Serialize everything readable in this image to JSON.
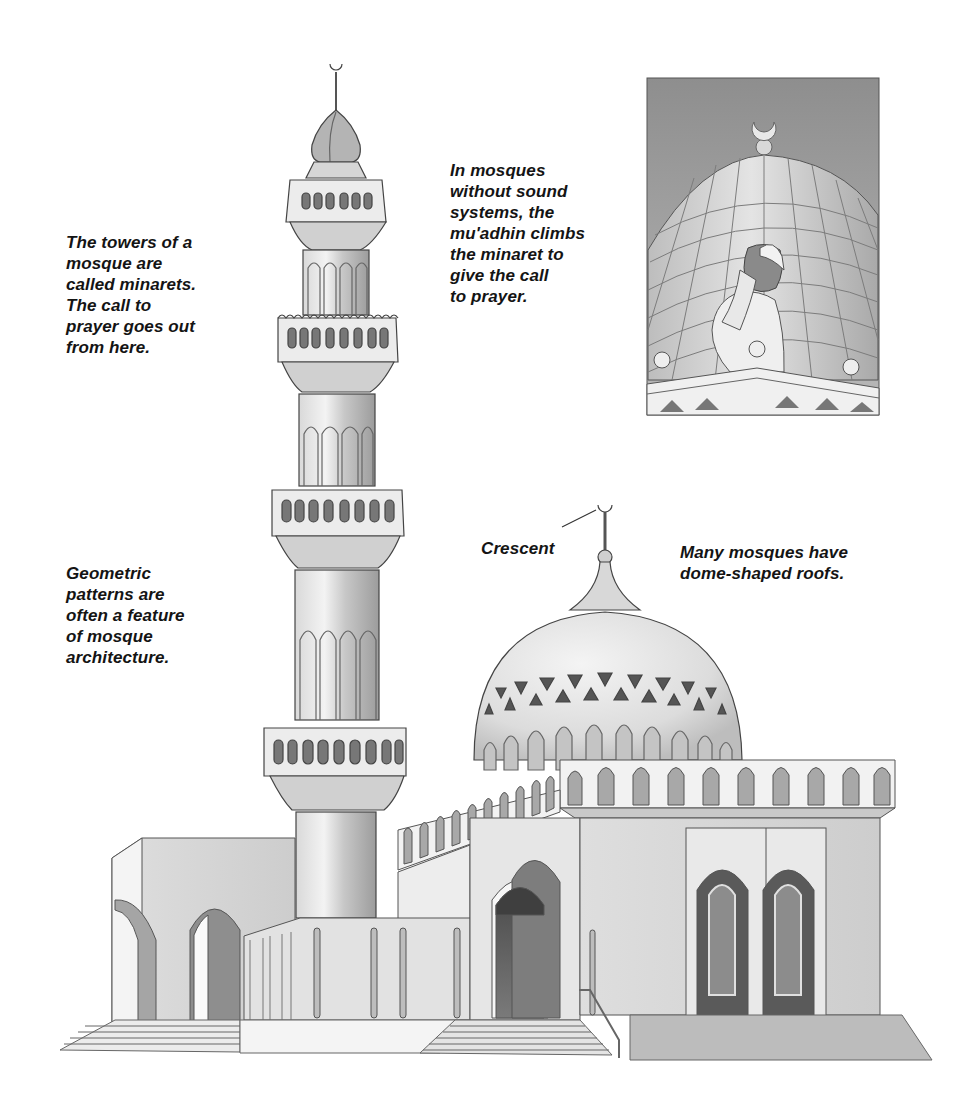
{
  "illustration": {
    "subject": "mosque with minaret and dome",
    "colors": {
      "background": "#ffffff",
      "ink": "#3a3a3a",
      "light_wall": "#e6e6e6",
      "mid_wall": "#cfcfcf",
      "shadow": "#9a9a9a",
      "dark": "#5e5e5e",
      "sky_inset": "#a8a8a8"
    }
  },
  "captions": {
    "minarets": "The towers of a\nmosque are\ncalled minarets.\nThe call to\nprayer goes out\nfrom here.",
    "muadhin": "In mosques\nwithout sound\nsystems, the\nmu'adhin climbs\nthe minaret to\ngive the call\nto prayer.",
    "geometric": "Geometric\npatterns are\noften a feature\nof mosque\narchitecture.",
    "domes": "Many mosques have\ndome-shaped roofs.",
    "crescent_label": "Crescent"
  },
  "inset": {
    "subject": "mu'adhin giving the call to prayer in front of a tiled dome with crescent finial"
  }
}
